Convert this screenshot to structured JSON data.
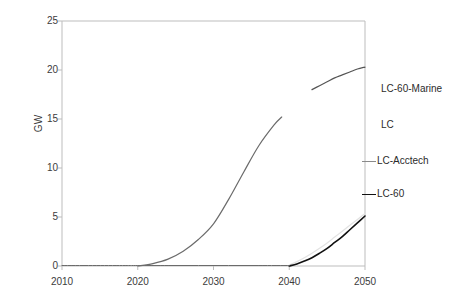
{
  "chart_data": {
    "type": "line",
    "title": "",
    "xlabel": "",
    "ylabel": "GW",
    "xlim": [
      2010,
      2050
    ],
    "ylim": [
      0,
      25
    ],
    "grid": false,
    "legend_position": "right",
    "xticks": [
      "2010",
      "2020",
      "2030",
      "2040",
      "2050"
    ],
    "yticks": [
      "0",
      "5",
      "10",
      "15",
      "20",
      "25"
    ],
    "series": [
      {
        "name": "LC-60-Marine",
        "color": "#555555",
        "width": 1.2,
        "x": [
          2043,
          2044,
          2045,
          2046,
          2047,
          2048,
          2049,
          2050
        ],
        "values": [
          18.0,
          18.4,
          18.8,
          19.2,
          19.5,
          19.8,
          20.1,
          20.3
        ]
      },
      {
        "name": "LC",
        "color": "#e2e2e2",
        "width": 1.2,
        "x": [
          2040,
          2041,
          2042,
          2043,
          2044,
          2045,
          2046,
          2047,
          2048,
          2049,
          2050
        ],
        "values": [
          0.1,
          0.45,
          0.85,
          1.3,
          1.8,
          2.35,
          2.95,
          3.55,
          4.15,
          4.75,
          5.35
        ]
      },
      {
        "name": "LC-Acctech",
        "color": "#6b6b6b",
        "width": 1.2,
        "x": [
          2020,
          2022,
          2024,
          2026,
          2028,
          2030,
          2032,
          2034,
          2036,
          2038,
          2039
        ],
        "values": [
          0.0,
          0.25,
          0.7,
          1.5,
          2.7,
          4.3,
          6.8,
          9.6,
          12.3,
          14.4,
          15.2
        ]
      },
      {
        "name": "LC-60",
        "color": "#111111",
        "width": 1.6,
        "x": [
          2040,
          2041,
          2042,
          2043,
          2044,
          2045,
          2046,
          2047,
          2048,
          2049,
          2050
        ],
        "values": [
          0.0,
          0.2,
          0.5,
          0.85,
          1.3,
          1.8,
          2.4,
          3.0,
          3.7,
          4.4,
          5.1
        ]
      },
      {
        "name": "baseline-flat",
        "color": "#6b6b6b",
        "width": 1.0,
        "x": [
          2010,
          2014,
          2018,
          2020,
          2024,
          2028,
          2032,
          2036,
          2040
        ],
        "values": [
          0.05,
          0.05,
          0.05,
          0.05,
          0.05,
          0.05,
          0.05,
          0.05,
          0.05
        ]
      }
    ],
    "legend_entries": [
      {
        "label": "LC-60-Marine",
        "color": "#f4f4f4",
        "has_marker": false
      },
      {
        "label": "LC",
        "color": "#f0f0f0",
        "has_marker": false
      },
      {
        "label": "LC-Acctech",
        "color": "#8a8a8a",
        "has_marker": true
      },
      {
        "label": "LC-60",
        "color": "#111111",
        "has_marker": true
      }
    ]
  },
  "axes": {
    "axis_color": "#bdbdbd",
    "tick_color": "#bdbdbd",
    "text_color": "#3c3c3c"
  }
}
